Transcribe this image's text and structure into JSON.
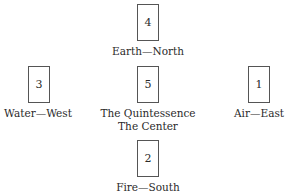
{
  "diagram": {
    "positions": [
      {
        "id": "north",
        "number": "4",
        "label": "Earth—North"
      },
      {
        "id": "west",
        "number": "3",
        "label": "Water—West"
      },
      {
        "id": "center",
        "number": "5",
        "label": "The Quintessence",
        "label2": "The Center"
      },
      {
        "id": "east",
        "number": "1",
        "label": "Air—East"
      },
      {
        "id": "south",
        "number": "2",
        "label": "Fire—South"
      }
    ]
  }
}
